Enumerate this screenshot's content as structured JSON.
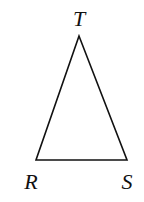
{
  "diagram": {
    "type": "triangle",
    "stroke_color": "#111111",
    "background": "#ffffff",
    "vertices": [
      {
        "name": "T",
        "label": "T",
        "x": 79,
        "y": 36,
        "label_x": 79,
        "label_y": 26
      },
      {
        "name": "R",
        "label": "R",
        "x": 36,
        "y": 160,
        "label_x": 30,
        "label_y": 190
      },
      {
        "name": "S",
        "label": "S",
        "x": 127,
        "y": 160,
        "label_x": 127,
        "label_y": 190
      }
    ],
    "edges": [
      [
        "T",
        "R"
      ],
      [
        "R",
        "S"
      ],
      [
        "S",
        "T"
      ]
    ]
  }
}
